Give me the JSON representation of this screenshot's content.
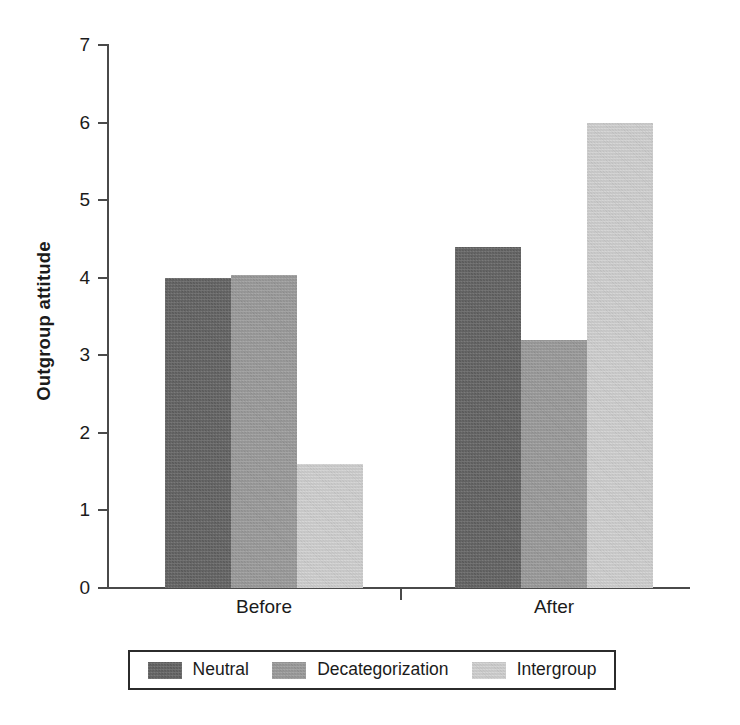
{
  "chart_data": {
    "type": "bar",
    "title": "",
    "xlabel": "",
    "ylabel": "Outgroup attitude",
    "categories": [
      "Before",
      "After"
    ],
    "series": [
      {
        "name": "Neutral",
        "values": [
          4.0,
          4.4
        ],
        "color": "#636363"
      },
      {
        "name": "Decategorization",
        "values": [
          4.03,
          3.2
        ],
        "color": "#9d9d9d"
      },
      {
        "name": "Intergroup",
        "values": [
          1.6,
          6.0
        ],
        "color": "#d5d5d5"
      }
    ],
    "ylim": [
      0,
      7
    ],
    "yticks": [
      0,
      1,
      2,
      3,
      4,
      5,
      6,
      7
    ],
    "ytick_labels": [
      "0",
      "1",
      "2",
      "3",
      "4",
      "5",
      "6",
      "7"
    ],
    "grid": false,
    "legend_position": "bottom"
  },
  "axes": {
    "y_axis_title": "Outgroup attitude"
  },
  "legend": {
    "items": [
      {
        "label": "Neutral",
        "color": "#636363"
      },
      {
        "label": "Decategorization",
        "color": "#9d9d9d"
      },
      {
        "label": "Intergroup",
        "color": "#d5d5d5"
      }
    ]
  }
}
